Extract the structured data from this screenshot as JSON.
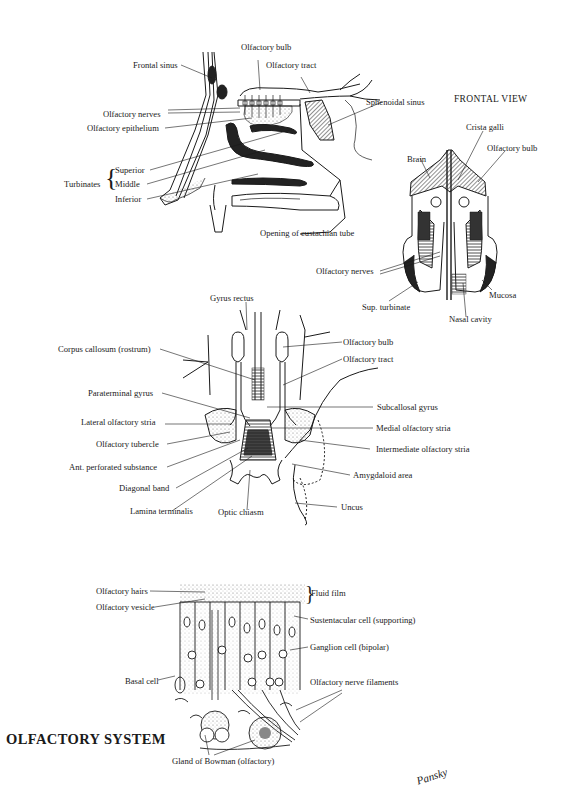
{
  "title": "OLFACTORY SYSTEM",
  "signature": "Pansky",
  "colors": {
    "ink": "#1a1a1a",
    "paper": "#ffffff",
    "stipple": "#9a9a9a",
    "dark_fill": "#2a2a2a"
  },
  "sagittal_view": {
    "labels": {
      "olfactory_bulb": "Olfactory bulb",
      "olfactory_tract": "Olfactory tract",
      "frontal_sinus": "Frontal sinus",
      "sphenoidal_sinus": "Sphenoidal sinus",
      "olfactory_nerves": "Olfactory nerves",
      "olfactory_epithelium": "Olfactory epithelium",
      "turbinates": "Turbinates",
      "superior": "Superior",
      "middle": "Middle",
      "inferior": "Inferior",
      "eustachian": "Opening of eustachian tube"
    }
  },
  "frontal_view": {
    "heading": "FRONTAL VIEW",
    "labels": {
      "crista_galli": "Crista galli",
      "olfactory_bulb": "Olfactory bulb",
      "brain": "Brain",
      "olfactory_nerves": "Olfactory nerves",
      "mucosa": "Mucosa",
      "sup_turbinate": "Sup. turbinate",
      "nasal_cavity": "Nasal cavity"
    }
  },
  "basal_view": {
    "labels": {
      "gyrus_rectus": "Gyrus rectus",
      "corpus_callosum": "Corpus callosum (rostrum)",
      "olfactory_bulb": "Olfactory bulb",
      "olfactory_tract": "Olfactory tract",
      "paraterminal_gyrus": "Paraterminal gyrus",
      "subcallosal_gyrus": "Subcallosal gyrus",
      "lateral_stria": "Lateral olfactory stria",
      "medial_stria": "Medial olfactory stria",
      "olfactory_tubercle": "Olfactory tubercle",
      "intermediate_stria": "Intermediate olfactory stria",
      "ant_perforated": "Ant. perforated substance",
      "amygdaloid": "Amygdaloid area",
      "diagonal_band": "Diagonal band",
      "uncus": "Uncus",
      "lamina_terminalis": "Lamina terminalis",
      "optic_chiasm": "Optic chiasm"
    }
  },
  "epithelium_view": {
    "labels": {
      "olfactory_hairs": "Olfactory hairs",
      "fluid_film": "Fluid film",
      "olfactory_vesicle": "Olfactory vesicle",
      "sustentacular": "Sustentacular cell (supporting)",
      "ganglion": "Ganglion cell (bipolar)",
      "basal_cell": "Basal cell",
      "nerve_filaments": "Olfactory nerve filaments",
      "gland_bowman": "Gland of Bowman (olfactory)"
    }
  }
}
